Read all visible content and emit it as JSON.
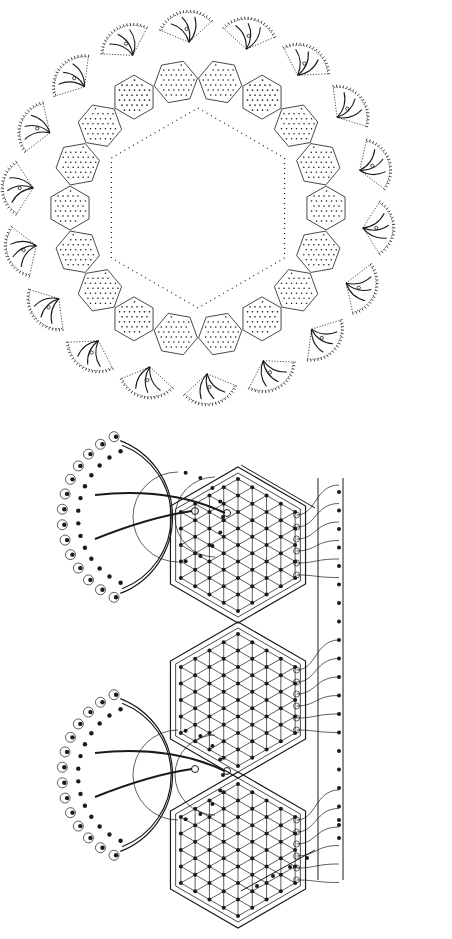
{
  "diagram": {
    "kind": "patent-style line drawing",
    "background": "#ffffff",
    "ink": "#1a1a1a",
    "figures": [
      {
        "id": "top-figure",
        "description": "Large hexagonal ring of dotted hexagonal modules with fan-shaped scalloped wiring lobes",
        "center": [
          198,
          208
        ],
        "inner_hexagon_radius": 100,
        "modules_per_side": 3,
        "lobe_count": 18
      },
      {
        "id": "bottom-figure",
        "description": "Enlarged detail: three hexagonal lattice modules with semicircular wiring lobes and parallel bus lines",
        "module_centers": [
          [
            238,
            545
          ],
          [
            238,
            700
          ],
          [
            238,
            850
          ]
        ],
        "module_radius": 78,
        "lobe_centers": [
          [
            150,
            517
          ],
          [
            150,
            775
          ]
        ],
        "lobe_radius": 82,
        "bus_lines_x": [
          318,
          343
        ],
        "bus_terminal_count": 19
      }
    ]
  }
}
